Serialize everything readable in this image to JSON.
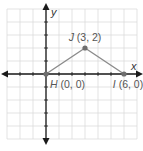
{
  "figure": {
    "type": "coordinate-plane",
    "grid": {
      "origin_px": [
        46,
        74
      ],
      "unit_px": 13,
      "x_range": [
        -3,
        7
      ],
      "y_range": [
        -5,
        5
      ],
      "grid_color": "#dcdcdc",
      "axis_color": "#1a1a1a"
    },
    "axes": {
      "x_label": "x",
      "y_label": "y"
    },
    "points": [
      {
        "name": "H",
        "coords": "(0, 0)",
        "x": 0,
        "y": 0
      },
      {
        "name": "J",
        "coords": "(3, 2)",
        "x": 3,
        "y": 2
      },
      {
        "name": "I",
        "coords": "(6, 0)",
        "x": 6,
        "y": 0
      }
    ],
    "segments": [
      [
        "H",
        "J"
      ],
      [
        "J",
        "I"
      ]
    ],
    "colors": {
      "segment": "#8a8a8a",
      "point": "#6e6e6e",
      "label": "#555555"
    }
  }
}
